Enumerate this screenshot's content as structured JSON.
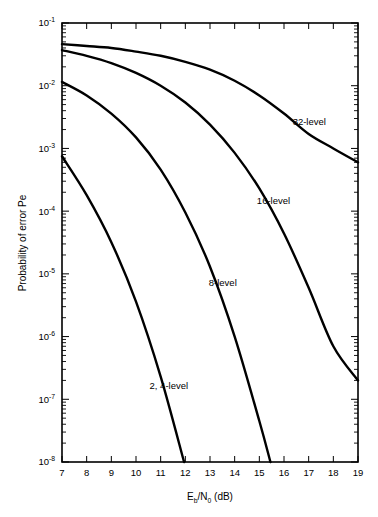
{
  "chart_data": {
    "type": "line",
    "title": "",
    "xlabel": "Eb/N0 (dB)",
    "xlabel_parts": {
      "main1": "E",
      "sub1": "b",
      "slash": "/N",
      "sub2": "0",
      "units": " (dB)"
    },
    "ylabel": "Probability of error Pe",
    "xlim": [
      7,
      19
    ],
    "ylim": [
      1e-08,
      0.1
    ],
    "yscale": "log",
    "xscale": "linear",
    "grid": false,
    "legend_position": "inline-annotations",
    "xticks": [
      7,
      8,
      9,
      10,
      11,
      12,
      13,
      14,
      15,
      16,
      17,
      18,
      19
    ],
    "xticklabels": [
      "7",
      "8",
      "9",
      "10",
      "11",
      "12",
      "13",
      "14",
      "15",
      "16",
      "17",
      "18",
      "19"
    ],
    "yticks": [
      0.1,
      0.01,
      0.001,
      0.0001,
      1e-05,
      1e-06,
      1e-07,
      1e-08
    ],
    "yticklabels": [
      {
        "base": "10",
        "exp": "-1"
      },
      {
        "base": "10",
        "exp": "-2"
      },
      {
        "base": "10",
        "exp": "-3"
      },
      {
        "base": "10",
        "exp": "-4"
      },
      {
        "base": "10",
        "exp": "-5"
      },
      {
        "base": "10",
        "exp": "-6"
      },
      {
        "base": "10",
        "exp": "-7"
      },
      {
        "base": "10",
        "exp": "-8"
      }
    ],
    "series": [
      {
        "name": "32-level",
        "label": "32-level",
        "label_x": 16.35,
        "label_y": 0.0024,
        "x": [
          7.0,
          8.0,
          9.0,
          10.0,
          11.0,
          12.0,
          13.0,
          14.0,
          15.0,
          16.0,
          17.0,
          18.0,
          19.0
        ],
        "y": [
          0.046,
          0.043,
          0.04,
          0.035,
          0.03,
          0.024,
          0.018,
          0.012,
          0.007,
          0.0036,
          0.0017,
          0.001,
          0.0006
        ]
      },
      {
        "name": "16-level",
        "label": "16-level",
        "label_x": 14.9,
        "label_y": 0.00013,
        "x": [
          7.0,
          8.0,
          9.0,
          10.0,
          11.0,
          12.0,
          13.0,
          14.0,
          15.0,
          16.0,
          17.0,
          18.0,
          19.0
        ],
        "y": [
          0.037,
          0.03,
          0.023,
          0.016,
          0.01,
          0.0054,
          0.0024,
          0.00085,
          0.00023,
          4.4e-05,
          6e-06,
          7e-07,
          2e-07
        ]
      },
      {
        "name": "8-level",
        "label": "8-level",
        "label_x": 12.95,
        "label_y": 6.3e-06,
        "x": [
          7.0,
          8.0,
          9.0,
          10.0,
          11.0,
          12.0,
          13.0,
          14.0,
          15.0,
          15.45
        ],
        "y": [
          0.0115,
          0.007,
          0.0036,
          0.0015,
          0.00046,
          9.5e-05,
          1.3e-05,
          1e-06,
          4.5e-08,
          1e-08
        ]
      },
      {
        "name": "2, 4-level",
        "label": "2, 4-level",
        "label_x": 10.55,
        "label_y": 1.45e-07,
        "x": [
          7.0,
          8.0,
          9.0,
          10.0,
          11.0,
          11.95
        ],
        "y": [
          0.00075,
          0.00018,
          3.2e-05,
          3.6e-06,
          2.3e-07,
          1e-08
        ]
      }
    ]
  },
  "colors": {
    "curve": "#000000",
    "axis": "#000000",
    "background": "#ffffff"
  }
}
